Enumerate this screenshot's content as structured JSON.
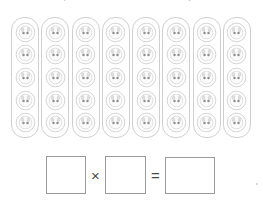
{
  "worksheet": {
    "title": "Multiplication array worksheet",
    "instruction_clipped": "Write a multiplication sentence for the array.",
    "array": {
      "group_count": 8,
      "items_per_group": 5,
      "total_items": 40,
      "icon_name": "animal-face-counter-icon",
      "group_outline_color": "#cfcfcf",
      "icon_color": "#d2d2d2",
      "icon_eye_color": "#8f8f8f",
      "groups": [
        {
          "label": "group-1",
          "items": [
            "counter-1",
            "counter-2",
            "counter-3",
            "counter-4",
            "counter-5"
          ]
        },
        {
          "label": "group-2",
          "items": [
            "counter-1",
            "counter-2",
            "counter-3",
            "counter-4",
            "counter-5"
          ]
        },
        {
          "label": "group-3",
          "items": [
            "counter-1",
            "counter-2",
            "counter-3",
            "counter-4",
            "counter-5"
          ]
        },
        {
          "label": "group-4",
          "items": [
            "counter-1",
            "counter-2",
            "counter-3",
            "counter-4",
            "counter-5"
          ]
        },
        {
          "label": "group-5",
          "items": [
            "counter-1",
            "counter-2",
            "counter-3",
            "counter-4",
            "counter-5"
          ]
        },
        {
          "label": "group-6",
          "items": [
            "counter-1",
            "counter-2",
            "counter-3",
            "counter-4",
            "counter-5"
          ]
        },
        {
          "label": "group-7",
          "items": [
            "counter-1",
            "counter-2",
            "counter-3",
            "counter-4",
            "counter-5"
          ]
        },
        {
          "label": "group-8",
          "items": [
            "counter-1",
            "counter-2",
            "counter-3",
            "counter-4",
            "counter-5"
          ]
        }
      ]
    },
    "equation": {
      "factor_a_value": "",
      "factor_a_placeholder": "",
      "times_symbol": "×",
      "factor_b_value": "",
      "factor_b_placeholder": "",
      "equals_symbol": "=",
      "product_value": "",
      "product_placeholder": "",
      "box_border_color": "#9a9a9a",
      "symbol_color": "#4a4a4a"
    }
  }
}
